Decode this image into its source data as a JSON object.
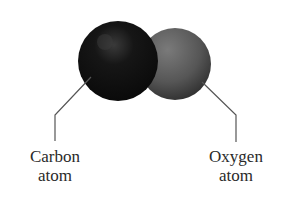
{
  "diagram": {
    "molecule": "carbon monoxide",
    "atoms": [
      {
        "name": "carbon",
        "line1": "Carbon",
        "line2": "atom",
        "color": "#151515"
      },
      {
        "name": "oxygen",
        "line1": "Oxygen",
        "line2": "atom",
        "color": "#5a5a5a"
      }
    ]
  }
}
